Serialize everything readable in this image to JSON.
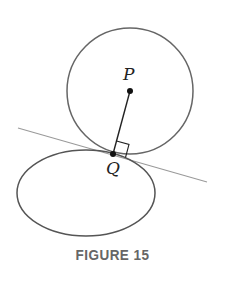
{
  "figure": {
    "caption": "FIGURE 15",
    "labels": {
      "P": "P",
      "Q": "Q"
    },
    "colors": {
      "stroke": "#666666",
      "line": "#999999",
      "point": "#111111"
    }
  }
}
